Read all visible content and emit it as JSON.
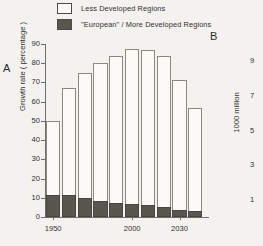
{
  "figure": {
    "panel_a_label": "A",
    "panel_b_label": "B"
  },
  "legend": {
    "items": [
      {
        "label": "Less Developed Regions",
        "swatch": "open",
        "color": "#fbfaf7"
      },
      {
        "label": "\"European\" / More Developed Regions",
        "swatch": "filled",
        "color": "#57564f"
      }
    ]
  },
  "chart_data": {
    "type": "bar",
    "title": "",
    "xlabel": "",
    "ylabel": "Growth rate ( percentage )",
    "y2label": "1000 million",
    "ylim": [
      0,
      90
    ],
    "y2lim": [
      0,
      10
    ],
    "grid": false,
    "legend_position": "top",
    "stacked": true,
    "categories": [
      "1950",
      "1960",
      "1970",
      "1980",
      "1990",
      "2000",
      "2010",
      "2020",
      "2030",
      "2040"
    ],
    "x": [
      1950,
      1960,
      1970,
      1980,
      1990,
      2000,
      2010,
      2020,
      2030,
      2040
    ],
    "yticks": [
      0,
      10,
      20,
      30,
      40,
      50,
      60,
      70,
      80,
      90
    ],
    "ytick_labels": [
      "0",
      "10",
      "20",
      "30",
      "40",
      "50",
      "60",
      "70",
      "80",
      "90"
    ],
    "y2ticks": [
      1,
      3,
      5,
      7,
      9
    ],
    "y2tick_labels": [
      "1",
      "3",
      "5",
      "7",
      "9"
    ],
    "xtick_values": [
      1950,
      2000,
      2030
    ],
    "xtick_labels": [
      "1950",
      "2000",
      "2030"
    ],
    "series": [
      {
        "name": "Less Developed Regions",
        "color": "#fbfaf7",
        "values": [
          38.5,
          55.5,
          65.0,
          71.5,
          76.5,
          80.5,
          81.0,
          79.0,
          68.0,
          53.5
        ]
      },
      {
        "name": "\"European\" / More Developed Regions",
        "color": "#57564f",
        "values": [
          11.5,
          11.5,
          10.0,
          8.5,
          7.5,
          7.0,
          6.0,
          5.0,
          3.5,
          3.0
        ]
      }
    ],
    "totals": [
      50.0,
      67.0,
      75.0,
      80.0,
      84.0,
      87.5,
      87.0,
      84.0,
      71.5,
      56.5
    ]
  }
}
